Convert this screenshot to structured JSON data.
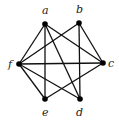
{
  "diagram": {
    "type": "graph",
    "directed": false,
    "colors": {
      "edge": "#111111",
      "node": "#000000",
      "label": "#222222"
    },
    "nodes": [
      {
        "id": "a",
        "label": "a",
        "x": 45,
        "y": 24,
        "lx": 42,
        "ly": 14
      },
      {
        "id": "b",
        "label": "b",
        "x": 79,
        "y": 23,
        "lx": 76,
        "ly": 13
      },
      {
        "id": "c",
        "label": "c",
        "x": 103,
        "y": 63,
        "lx": 108,
        "ly": 67
      },
      {
        "id": "d",
        "label": "d",
        "x": 80,
        "y": 99,
        "lx": 76,
        "ly": 116
      },
      {
        "id": "e",
        "label": "e",
        "x": 45,
        "y": 99,
        "lx": 42,
        "ly": 116
      },
      {
        "id": "f",
        "label": "f",
        "x": 19,
        "y": 64,
        "lx": 8,
        "ly": 68
      }
    ],
    "edges": [
      [
        "a",
        "e"
      ],
      [
        "a",
        "f"
      ],
      [
        "a",
        "c"
      ],
      [
        "a",
        "d"
      ],
      [
        "b",
        "d"
      ],
      [
        "b",
        "f"
      ],
      [
        "b",
        "c"
      ],
      [
        "f",
        "c"
      ],
      [
        "f",
        "e"
      ],
      [
        "f",
        "d"
      ],
      [
        "c",
        "e"
      ]
    ]
  }
}
